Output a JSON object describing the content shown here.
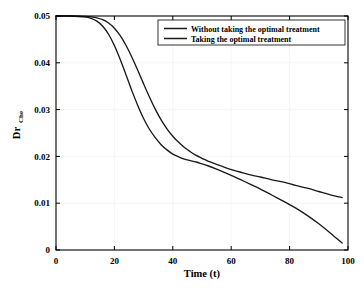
{
  "chart_data": {
    "type": "line",
    "title": "",
    "xlabel": "Time (t)",
    "ylabel": "Dr",
    "ylabel_sub": "Che",
    "xlim": [
      0,
      100
    ],
    "ylim": [
      0,
      0.05
    ],
    "xticks": [
      0,
      20,
      40,
      60,
      80,
      100
    ],
    "xtick_labels": [
      "0",
      "20",
      "40",
      "60",
      "80",
      "100"
    ],
    "yticks": [
      0,
      0.01,
      0.02,
      0.03,
      0.04,
      0.05
    ],
    "ytick_labels": [
      "0",
      "0.01",
      "0.02",
      "0.03",
      "0.04",
      "0.05"
    ],
    "grid": true,
    "legend_position": "top-right",
    "line_color": "#1a1a1a",
    "series": [
      {
        "name": "Without taking the optimal treatment",
        "x": [
          0,
          5,
          10,
          12,
          14,
          16,
          18,
          20,
          22,
          24,
          26,
          28,
          30,
          32,
          34,
          36,
          38,
          40,
          42,
          44,
          46,
          48,
          50,
          52,
          55,
          58,
          61,
          64,
          67,
          70,
          74,
          78,
          82,
          86,
          90,
          94,
          98
        ],
        "y": [
          0.05,
          0.05,
          0.0499,
          0.0498,
          0.0496,
          0.0492,
          0.0485,
          0.0474,
          0.0458,
          0.0437,
          0.0412,
          0.0384,
          0.0355,
          0.0327,
          0.0301,
          0.0278,
          0.0259,
          0.0243,
          0.023,
          0.0219,
          0.021,
          0.0202,
          0.0196,
          0.019,
          0.0183,
          0.0176,
          0.017,
          0.0165,
          0.016,
          0.0156,
          0.015,
          0.0145,
          0.0138,
          0.0132,
          0.0125,
          0.0118,
          0.0112
        ]
      },
      {
        "name": "Taking the optimal treatment",
        "x": [
          0,
          5,
          10,
          12,
          14,
          16,
          18,
          20,
          22,
          24,
          26,
          28,
          30,
          32,
          34,
          36,
          38,
          40,
          42,
          44,
          46,
          48,
          50,
          52,
          55,
          58,
          61,
          64,
          67,
          70,
          74,
          78,
          82,
          86,
          90,
          94,
          98
        ],
        "y": [
          0.05,
          0.05,
          0.0498,
          0.0495,
          0.0489,
          0.0478,
          0.0461,
          0.0437,
          0.0407,
          0.0374,
          0.034,
          0.0309,
          0.0281,
          0.0258,
          0.024,
          0.0225,
          0.0214,
          0.0205,
          0.0199,
          0.0194,
          0.0191,
          0.0188,
          0.0184,
          0.018,
          0.0173,
          0.0165,
          0.0157,
          0.0148,
          0.0139,
          0.013,
          0.0117,
          0.0104,
          0.009,
          0.0074,
          0.0056,
          0.0036,
          0.0015
        ]
      }
    ]
  }
}
